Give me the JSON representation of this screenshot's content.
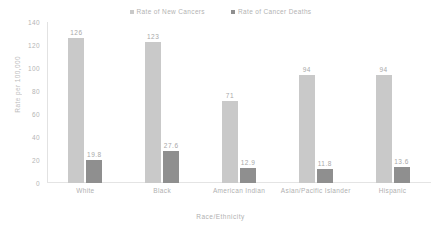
{
  "chart_data": {
    "type": "bar",
    "title": "",
    "subtitle": "",
    "xlabel": "Race/Ethnicity",
    "ylabel": "Rate per 100,000",
    "categories": [
      "White",
      "Black",
      "American Indian",
      "Asian/Pacific Islander",
      "Hispanic"
    ],
    "series": [
      {
        "name": "Rate of New Cancers",
        "color": "#c9c9c9",
        "values": [
          126,
          123,
          71,
          94,
          94
        ],
        "labels": [
          "126",
          "123",
          "71",
          "94",
          "94"
        ]
      },
      {
        "name": "Rate of Cancer Deaths",
        "color": "#8f8f8f",
        "values": [
          19.8,
          27.6,
          12.9,
          11.8,
          13.6
        ],
        "labels": [
          "19.8",
          "27.6",
          "12.9",
          "11.8",
          "13.6"
        ]
      }
    ],
    "ylim": [
      0,
      140
    ],
    "yticks": [
      140,
      120,
      100,
      80,
      60,
      40,
      20,
      0
    ],
    "ytick_labels": [
      "140",
      "120",
      "100",
      "80",
      "60",
      "40",
      "20",
      "0"
    ],
    "grid": false,
    "legend_position": "top-center"
  },
  "colors": {
    "series_new_cancers": "#c9c9c9",
    "series_cancer_deaths": "#8f8f8f",
    "axis": "#e2e2e2",
    "text": "#b0b0b0",
    "background": "#ffffff"
  }
}
